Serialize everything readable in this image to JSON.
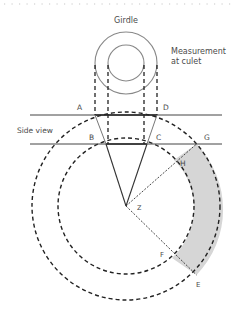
{
  "diagram": {
    "labels": {
      "girdle": "Girdle",
      "measurement_line1": "Measurement",
      "measurement_line2": "at culet",
      "side_view": "Side view",
      "points": {
        "A": "A",
        "B": "B",
        "C": "C",
        "D": "D",
        "E": "E",
        "F": "F",
        "G": "G",
        "H": "H",
        "Z": "Z"
      }
    },
    "colors": {
      "stroke": "#333333",
      "light_stroke": "#888888",
      "shade": "#d6d6d6",
      "dot_border": "#c8c8c8"
    }
  }
}
